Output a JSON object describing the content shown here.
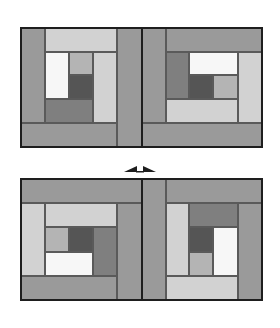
{
  "colors": {
    "dark": "#555555",
    "mid_dark": "#7f7f7f",
    "medium": "#9a9a9a",
    "light_gray": "#b4b4b4",
    "light": "#d2d2d2",
    "white": "#f7f7f7",
    "frame": "#1e1e1e"
  },
  "blocks": [
    {
      "name": "top-left-block",
      "patches": [
        {
          "x": 21,
          "y": 28,
          "w": 24,
          "h": 95,
          "color": "medium"
        },
        {
          "x": 45,
          "y": 28,
          "w": 72,
          "h": 24,
          "color": "light"
        },
        {
          "x": 45,
          "y": 52,
          "w": 24,
          "h": 47,
          "color": "white"
        },
        {
          "x": 69,
          "y": 52,
          "w": 24,
          "h": 23,
          "color": "light_gray"
        },
        {
          "x": 69,
          "y": 75,
          "w": 24,
          "h": 24,
          "color": "dark"
        },
        {
          "x": 45,
          "y": 99,
          "w": 48,
          "h": 24,
          "color": "mid_dark"
        },
        {
          "x": 93,
          "y": 52,
          "w": 24,
          "h": 71,
          "color": "light"
        },
        {
          "x": 21,
          "y": 123,
          "w": 96,
          "h": 24,
          "color": "medium"
        },
        {
          "x": 117,
          "y": 28,
          "w": 25,
          "h": 119,
          "color": "medium"
        }
      ]
    },
    {
      "name": "top-right-block",
      "patches": [
        {
          "x": 142,
          "y": 28,
          "w": 24,
          "h": 95,
          "color": "medium"
        },
        {
          "x": 166,
          "y": 28,
          "w": 96,
          "h": 24,
          "color": "medium"
        },
        {
          "x": 166,
          "y": 52,
          "w": 23,
          "h": 47,
          "color": "mid_dark"
        },
        {
          "x": 189,
          "y": 52,
          "w": 49,
          "h": 23,
          "color": "white"
        },
        {
          "x": 189,
          "y": 75,
          "w": 24,
          "h": 24,
          "color": "dark"
        },
        {
          "x": 213,
          "y": 75,
          "w": 25,
          "h": 24,
          "color": "light_gray"
        },
        {
          "x": 166,
          "y": 99,
          "w": 72,
          "h": 24,
          "color": "light"
        },
        {
          "x": 238,
          "y": 52,
          "w": 24,
          "h": 71,
          "color": "light"
        },
        {
          "x": 142,
          "y": 123,
          "w": 120,
          "h": 24,
          "color": "medium"
        }
      ]
    },
    {
      "name": "bottom-left-block",
      "patches": [
        {
          "x": 21,
          "y": 179,
          "w": 121,
          "h": 24,
          "color": "medium"
        },
        {
          "x": 21,
          "y": 203,
          "w": 24,
          "h": 73,
          "color": "light"
        },
        {
          "x": 45,
          "y": 203,
          "w": 72,
          "h": 24,
          "color": "light"
        },
        {
          "x": 45,
          "y": 227,
          "w": 24,
          "h": 25,
          "color": "light_gray"
        },
        {
          "x": 69,
          "y": 227,
          "w": 24,
          "h": 25,
          "color": "dark"
        },
        {
          "x": 93,
          "y": 227,
          "w": 24,
          "h": 49,
          "color": "mid_dark"
        },
        {
          "x": 45,
          "y": 252,
          "w": 48,
          "h": 24,
          "color": "white"
        },
        {
          "x": 117,
          "y": 203,
          "w": 25,
          "h": 97,
          "color": "medium"
        },
        {
          "x": 21,
          "y": 276,
          "w": 96,
          "h": 24,
          "color": "medium"
        }
      ]
    },
    {
      "name": "bottom-right-block",
      "patches": [
        {
          "x": 142,
          "y": 179,
          "w": 24,
          "h": 121,
          "color": "medium"
        },
        {
          "x": 166,
          "y": 179,
          "w": 96,
          "h": 24,
          "color": "medium"
        },
        {
          "x": 166,
          "y": 203,
          "w": 23,
          "h": 73,
          "color": "light"
        },
        {
          "x": 189,
          "y": 203,
          "w": 49,
          "h": 24,
          "color": "mid_dark"
        },
        {
          "x": 189,
          "y": 227,
          "w": 24,
          "h": 25,
          "color": "dark"
        },
        {
          "x": 213,
          "y": 227,
          "w": 25,
          "h": 49,
          "color": "white"
        },
        {
          "x": 189,
          "y": 252,
          "w": 24,
          "h": 24,
          "color": "light_gray"
        },
        {
          "x": 238,
          "y": 203,
          "w": 24,
          "h": 97,
          "color": "medium"
        },
        {
          "x": 166,
          "y": 276,
          "w": 72,
          "h": 24,
          "color": "light"
        }
      ]
    }
  ],
  "frames": [
    {
      "name": "top-quilt-frame",
      "x": 20,
      "y": 27,
      "w": 243,
      "h": 121,
      "divider_x": 141
    },
    {
      "name": "bottom-quilt-frame",
      "x": 20,
      "y": 178,
      "w": 243,
      "h": 123,
      "divider_x": 141
    }
  ],
  "arrow": {
    "label": "swap-arrow",
    "x": 124,
    "y": 161,
    "w": 32,
    "h": 14
  }
}
